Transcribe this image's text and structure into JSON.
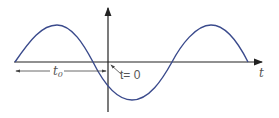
{
  "diagram": {
    "x_axis_label": "t",
    "offset_label": "t",
    "offset_subscript": "0",
    "origin_label": "t= 0",
    "curve_color": "#3a4a8c",
    "axis_color": "#222222"
  }
}
